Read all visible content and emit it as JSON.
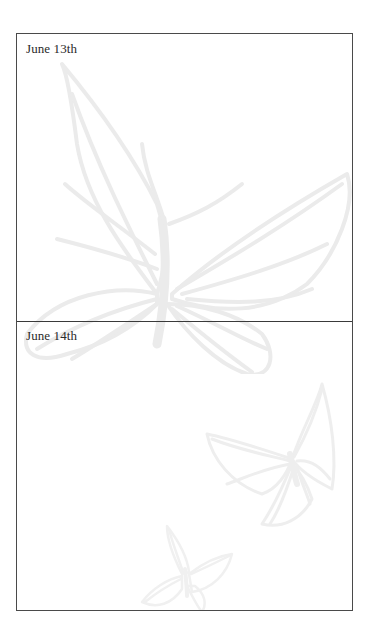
{
  "page": {
    "sections": [
      {
        "label": "June 13th"
      },
      {
        "label": "June 14th"
      }
    ],
    "background": {
      "watermark": "butterfly-illustrations",
      "watermark_color": "#ececec"
    },
    "colors": {
      "frame_border": "#4a4a4a",
      "divider": "#3a3a3a",
      "text": "#2a2a2a",
      "background": "#ffffff"
    }
  }
}
